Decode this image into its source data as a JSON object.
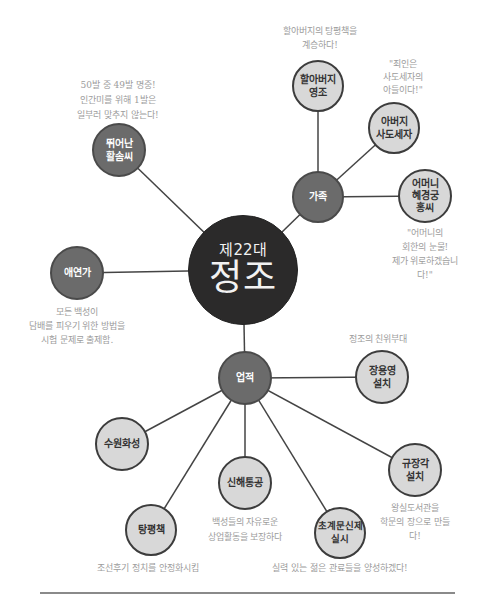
{
  "center": {
    "era": "제22대",
    "name": "정조"
  },
  "branches": {
    "family": {
      "label": "가족",
      "children": {
        "grandfather": {
          "label": "할아버지\n영조",
          "caption": "할아버지의 탕평책을\n계승하다!"
        },
        "father": {
          "label": "아버지\n사도세자",
          "caption": "\"죄인은\n사도세자의\n아들이다!\""
        },
        "mother": {
          "label": "어머니\n혜경궁\n홍씨",
          "caption": "\"어머니의\n회한의 눈물!\n제가 위로하겠습니다!\""
        }
      }
    },
    "archery": {
      "label": "뛰어난\n활솜씨",
      "caption": "50발 중 49발 명중!\n인간미를 위해 1발은\n일부러 맞추지 않는다!"
    },
    "smoker": {
      "label": "애연가",
      "caption": "모든 백성이\n담배를 피우기 위한 방법을\n시험 문제로 출제함."
    },
    "achievements": {
      "label": "업적",
      "children": {
        "jangyongyeong": {
          "label": "장용영\n설치",
          "caption": "정조의 친위부대"
        },
        "suwon": {
          "label": "수원화성",
          "caption": ""
        },
        "sinhae": {
          "label": "신해통공",
          "caption": "백성들의 자유로운\n상업활동을 보장하다"
        },
        "tangpyeong": {
          "label": "탕평책",
          "caption": "조선후기 정치를 안정화시킴"
        },
        "gyujanggak": {
          "label": "규장각\n설치",
          "caption": "왕실도서관을\n학문의 장으로 만들다!"
        },
        "chogye": {
          "label": "초계문신제\n실시",
          "caption": "실력 있는 젊은 관료들을 양성하겠다!"
        }
      }
    }
  },
  "colors": {
    "center_fill": "#2b2a2a",
    "mid_fill": "#6b6b6b",
    "light_fill": "#d8d8d8",
    "line": "#444444",
    "caption_text": "#9c9c9c"
  }
}
